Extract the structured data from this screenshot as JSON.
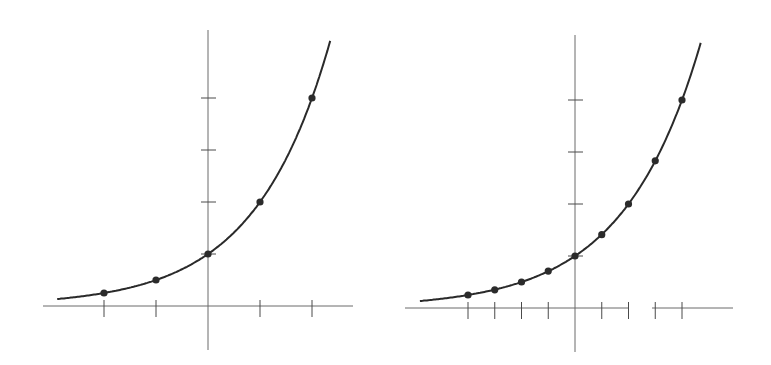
{
  "chart_data": [
    {
      "type": "line",
      "title": "",
      "function": "y = 2^x",
      "xlabel": "",
      "ylabel": "",
      "grid": false,
      "legend": null,
      "x_ticks": [
        -2,
        -1,
        1,
        2
      ],
      "y_ticks": [
        1,
        2,
        3,
        4
      ],
      "xlim": [
        -3,
        2.7
      ],
      "ylim": [
        -0.9,
        5.2
      ],
      "points": {
        "x": [
          -2,
          -1,
          0,
          1,
          2
        ],
        "y": [
          0.25,
          0.5,
          1,
          2,
          4
        ]
      },
      "curve_range": [
        -2.9,
        2.35
      ],
      "layout": {
        "origin_px": [
          208,
          306
        ],
        "unit_x_px": 52,
        "unit_y_px": 52,
        "x_axis_px": [
          43,
          353
        ],
        "y_axis_px": [
          30,
          350
        ]
      }
    },
    {
      "type": "line",
      "title": "",
      "function": "y = 2^x",
      "xlabel": "",
      "ylabel": "",
      "grid": false,
      "legend": null,
      "x_ticks": [
        -2,
        -1.5,
        -1,
        -0.5,
        0.5,
        1,
        1.5,
        2
      ],
      "y_ticks": [
        1,
        2,
        3,
        4
      ],
      "xlim": [
        -3.2,
        2.9
      ],
      "ylim": [
        -0.9,
        5.1
      ],
      "points": {
        "x": [
          -2,
          -1.5,
          -1,
          -0.5,
          0,
          0.5,
          1,
          1.5,
          2
        ],
        "y": [
          0.25,
          0.35,
          0.5,
          0.71,
          1,
          1.41,
          2,
          2.83,
          4
        ]
      },
      "curve_range": [
        -2.9,
        2.35
      ],
      "layout": {
        "origin_px": [
          575,
          308
        ],
        "unit_x_px": 53.5,
        "unit_y_px": 52,
        "x_axis_px": [
          405,
          733
        ],
        "y_axis_px": [
          35,
          352
        ],
        "axis_gap_px": [
          629,
          652
        ]
      }
    }
  ]
}
